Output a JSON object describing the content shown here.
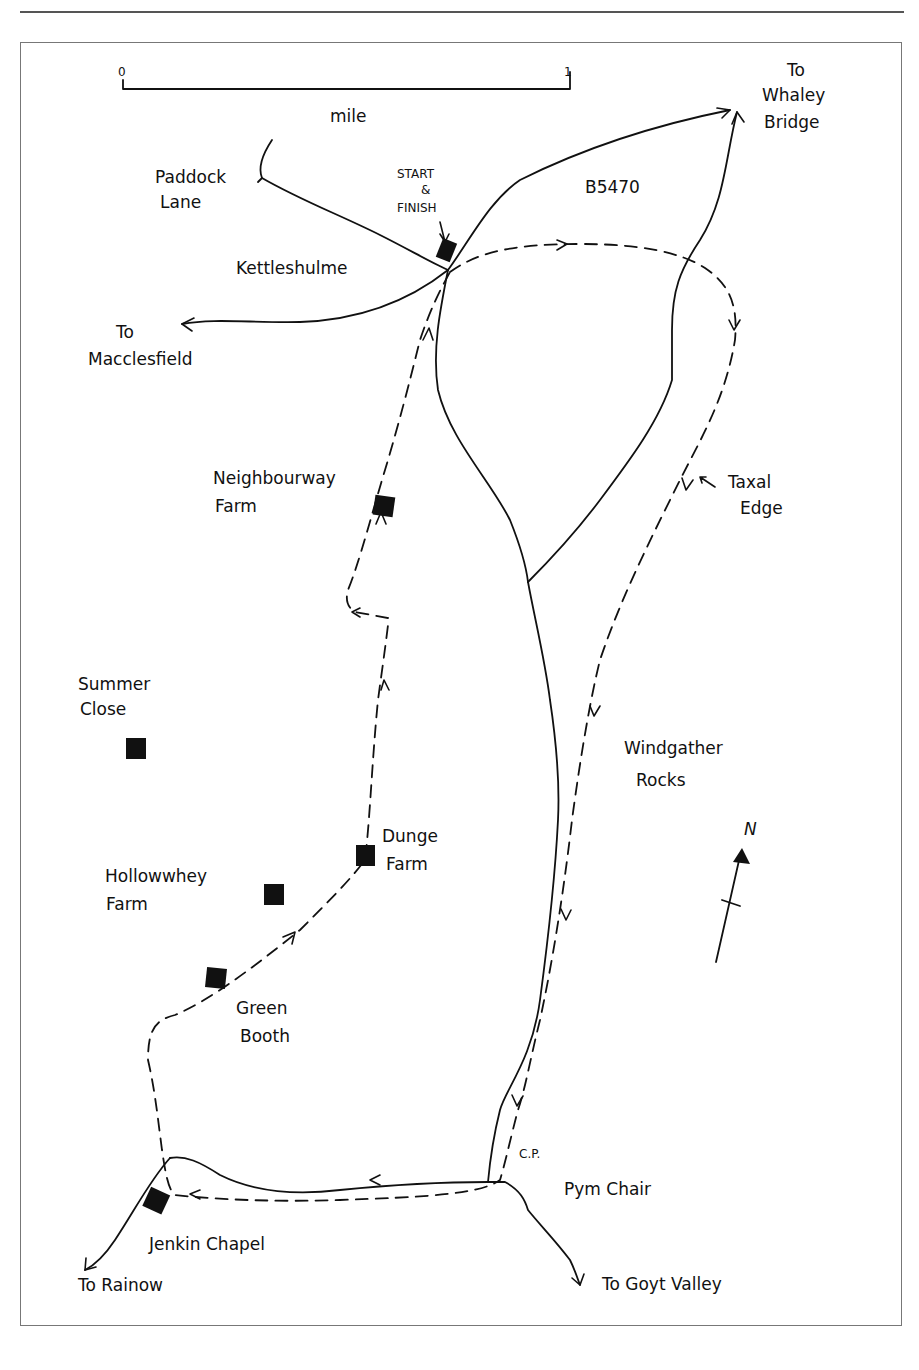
{
  "map": {
    "scale_bar": {
      "start_label": "0",
      "end_label": "1",
      "unit_label": "mile"
    },
    "north_label": "N",
    "road_label": "B5470",
    "start_finish": {
      "line1": "START",
      "line2": "&",
      "line3": "FINISH"
    },
    "places": {
      "paddock_lane": [
        "Paddock",
        "Lane"
      ],
      "kettleshulme": "Kettleshulme",
      "macclesfield": [
        "To",
        "Macclesfield"
      ],
      "whaley_bridge": [
        "To",
        "Whaley",
        "Bridge"
      ],
      "neighbourway_farm": [
        "Neighbourway",
        "Farm"
      ],
      "taxal_edge": [
        "Taxal",
        "Edge"
      ],
      "summer_close": [
        "Summer",
        "Close"
      ],
      "windgather_rocks": [
        "Windgather",
        "Rocks"
      ],
      "dunge_farm": [
        "Dunge",
        "Farm"
      ],
      "hollowwhey_farm": [
        "Hollowwhey",
        "Farm"
      ],
      "green_booth": [
        "Green",
        "Booth"
      ],
      "car_park": "C.P.",
      "pym_chair": "Pym Chair",
      "jenkin_chapel": "Jenkin Chapel",
      "rainow": "To Rainow",
      "goyt_valley": "To Goyt Valley"
    },
    "legend_colors": {
      "ink": "#111111",
      "frame": "#777777"
    }
  }
}
